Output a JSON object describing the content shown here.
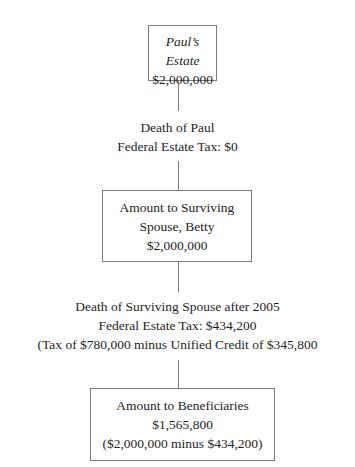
{
  "diagram": {
    "nodes": [
      {
        "id": "estate",
        "lines": [
          "Paul’s Estate",
          "$2,000,000"
        ]
      },
      {
        "id": "spouse",
        "lines": [
          "Amount to Surviving",
          "Spouse, Betty",
          "$2,000,000"
        ]
      },
      {
        "id": "beneficiaries",
        "lines": [
          "Amount to Beneficiaries",
          "$1,565,800",
          "($2,000,000 minus $434,200)"
        ]
      }
    ],
    "edges": [
      {
        "from": "estate",
        "to": "spouse",
        "lines": [
          "Death of Paul",
          "Federal Estate Tax: $0"
        ]
      },
      {
        "from": "spouse",
        "to": "beneficiaries",
        "lines": [
          "Death of Surviving Spouse after 2005",
          "Federal Estate Tax: $434,200",
          "(Tax of $780,000 minus Unified Credit of $345,800"
        ]
      }
    ]
  }
}
